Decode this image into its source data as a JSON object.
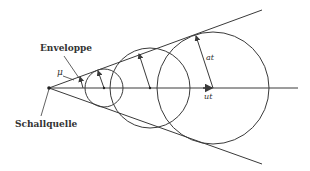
{
  "diagram": {
    "labels": {
      "envelope": "Enveloppe",
      "source": "Schallquelle",
      "mach_angle": "μ",
      "wave_radius": "at",
      "source_displacement": "ut"
    },
    "colors": {
      "line": "#3a3a3a",
      "text": "#333333",
      "background": "#ffffff"
    },
    "geometry": {
      "source": {
        "x": 49,
        "y": 88
      },
      "axis_end_x": 298,
      "envelope_upper_end": {
        "x": 262,
        "y": 10
      },
      "envelope_lower_end": {
        "x": 262,
        "y": 164
      },
      "circles": [
        {
          "cx": 104,
          "cy": 88,
          "r": 19
        },
        {
          "cx": 150,
          "cy": 88,
          "r": 40
        },
        {
          "cx": 213,
          "cy": 88,
          "r": 56
        }
      ]
    }
  }
}
